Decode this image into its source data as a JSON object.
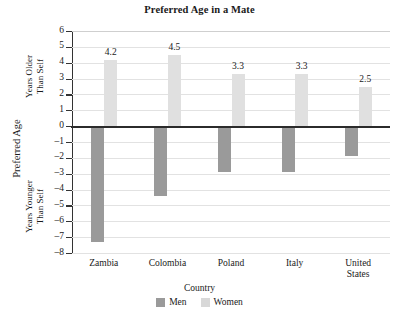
{
  "chart_data": {
    "type": "bar",
    "title": "Preferred Age in a Mate",
    "xlabel": "Country",
    "ylabel": "Preferred Age",
    "ylabel_upper": "Years Older Than Self",
    "ylabel_lower": "Years Younger Than Self",
    "categories": [
      "Zambia",
      "Colombia",
      "Poland",
      "Italy",
      "United States"
    ],
    "series": [
      {
        "name": "Men",
        "values": [
          -7.3,
          -4.4,
          -2.9,
          -2.9,
          -1.9
        ],
        "color": "#9a9a9a",
        "labels_shown": false
      },
      {
        "name": "Women",
        "values": [
          4.2,
          4.5,
          3.3,
          3.3,
          2.5
        ],
        "color": "#e0e0e0",
        "labels_shown": true
      }
    ],
    "value_labels": [
      "4.2",
      "4.5",
      "3.3",
      "3.3",
      "2.5"
    ],
    "ylim": [
      -8,
      6
    ],
    "yticks": [
      6,
      5,
      4,
      3,
      2,
      1,
      0,
      -1,
      -2,
      -3,
      -4,
      -5,
      -6,
      -7,
      -8
    ],
    "ytick_labels": [
      "6",
      "5",
      "4",
      "3",
      "2",
      "1",
      "0",
      "–1",
      "–2",
      "–3",
      "–4",
      "–5",
      "–6",
      "–7",
      "–8"
    ],
    "grid": true,
    "legend_position": "bottom"
  },
  "axis": {
    "upper_label_line1": "Years Older",
    "upper_label_line2": "Than Self",
    "lower_label_line1": "Years Younger",
    "lower_label_line2": "Than Self"
  },
  "category_lines": [
    {
      "line1": "Zambia",
      "line2": ""
    },
    {
      "line1": "Colombia",
      "line2": ""
    },
    {
      "line1": "Poland",
      "line2": ""
    },
    {
      "line1": "Italy",
      "line2": ""
    },
    {
      "line1": "United",
      "line2": "States"
    }
  ],
  "legend": {
    "items": [
      {
        "label": "Men"
      },
      {
        "label": "Women"
      }
    ]
  }
}
